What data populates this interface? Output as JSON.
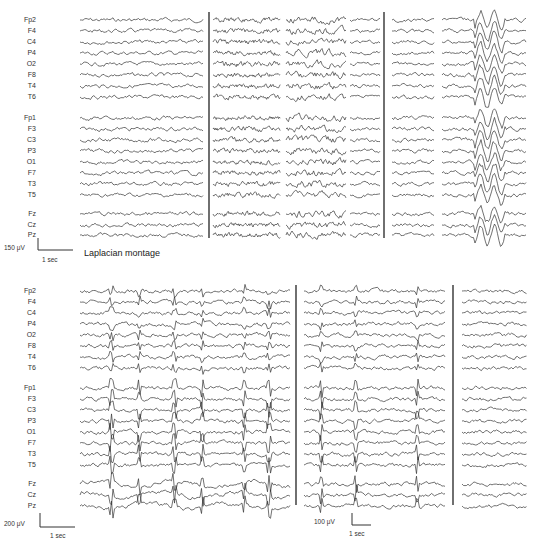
{
  "top_panel": {
    "channels": [
      "Fp2",
      "F4",
      "C4",
      "P4",
      "O2",
      "F8",
      "T4",
      "T6",
      "Fp1",
      "F3",
      "C3",
      "P3",
      "O1",
      "F7",
      "T3",
      "T5",
      "Fz",
      "Cz",
      "Pz"
    ],
    "scale_bar": {
      "amplitude": "150 μV",
      "time": "1 sec"
    },
    "montage_label": "Laplacian montage",
    "segments": [
      {
        "x0": 80,
        "x1": 204,
        "style": "normal"
      },
      {
        "x0": 213,
        "x1": 281,
        "style": "fast"
      },
      {
        "x0": 286,
        "x1": 346,
        "style": "sharp"
      },
      {
        "x0": 350,
        "x1": 380,
        "style": "normal"
      },
      {
        "x0": 392,
        "x1": 434,
        "style": "normal"
      },
      {
        "x0": 442,
        "x1": 527,
        "style": "burst"
      }
    ],
    "dividers": [
      209,
      384
    ]
  },
  "bottom_panel": {
    "channels": [
      "Fp2",
      "F4",
      "C4",
      "P4",
      "O2",
      "F8",
      "T4",
      "T6",
      "Fp1",
      "F3",
      "C3",
      "P3",
      "O1",
      "F7",
      "T3",
      "T5",
      "Fz",
      "Cz",
      "Pz"
    ],
    "scale_bars": [
      {
        "amplitude": "200 μV",
        "time": "1 sec"
      },
      {
        "amplitude": "100 μV",
        "time": "1 sec"
      }
    ],
    "segments": [
      {
        "x0": 80,
        "x1": 290,
        "style": "spikes"
      },
      {
        "x0": 304,
        "x1": 445,
        "style": "spikes-sparse"
      },
      {
        "x0": 462,
        "x1": 527,
        "style": "normal"
      }
    ],
    "dividers": [
      296,
      453
    ]
  }
}
